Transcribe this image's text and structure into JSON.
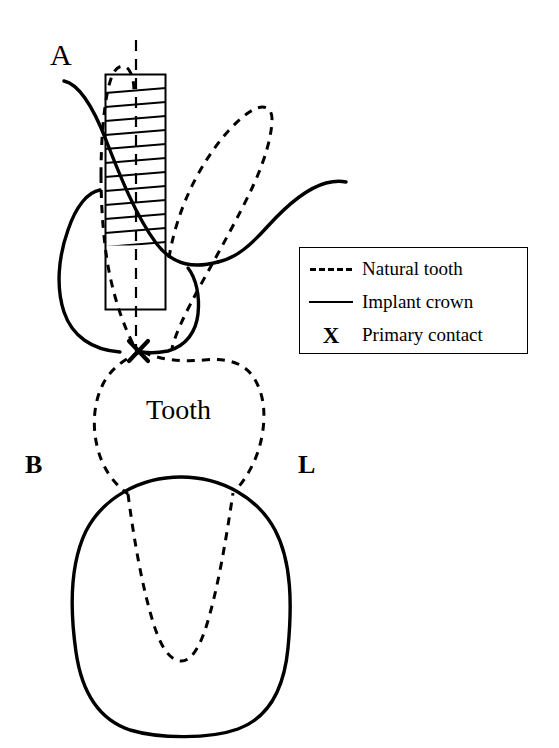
{
  "figure": {
    "type": "dental-cross-section-diagram",
    "background_color": "#ffffff",
    "stroke_color": "#000000",
    "width": 559,
    "height": 748
  },
  "labels": {
    "panel_letter": "A",
    "buccal": "B",
    "lingual": "L",
    "tooth": "Tooth"
  },
  "legend": {
    "border_color": "#000000",
    "items": [
      {
        "key": "dashed-line-key",
        "icon": "dashed-line-icon",
        "label": "Natural tooth"
      },
      {
        "key": "solid-line-key",
        "icon": "solid-line-icon",
        "label": "Implant crown"
      },
      {
        "key": "x-mark-key",
        "icon": "x-mark-icon",
        "glyph": "X",
        "label": "Primary contact"
      }
    ]
  },
  "markers": {
    "primary_contact_glyph": "X"
  },
  "shapes": {
    "abutment_rect": {
      "x": 105,
      "y": 74,
      "width": 61,
      "height": 236,
      "hatch_fill_to_y": 246
    },
    "centerline": {
      "x": 136,
      "y_top": 40,
      "y_bottom": 352,
      "style": "dashed"
    },
    "contact_point": {
      "x": 138,
      "y": 351
    }
  }
}
